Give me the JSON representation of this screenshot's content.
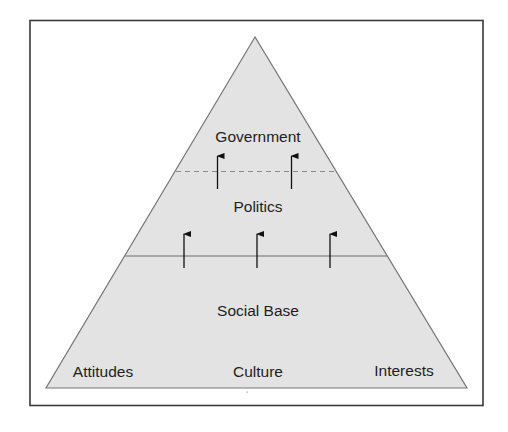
{
  "diagram": {
    "type": "pyramid",
    "colors": {
      "frame": "#3a3a3a",
      "pyramid_fill": "#e3e3e3",
      "pyramid_stroke": "#777777",
      "divider_solid": "#6f6f6f",
      "divider_dashed": "#8a8a8a",
      "arrow": "#111111",
      "text": "#1e1e1e"
    },
    "layers": [
      {
        "id": "government",
        "label": "Government",
        "position": "top"
      },
      {
        "id": "politics",
        "label": "Politics",
        "position": "middle"
      },
      {
        "id": "social_base",
        "label": "Social Base",
        "position": "bottom"
      }
    ],
    "dividers": [
      {
        "between": [
          "government",
          "politics"
        ],
        "style": "dashed"
      },
      {
        "between": [
          "politics",
          "social_base"
        ],
        "style": "solid"
      }
    ],
    "base_components": [
      {
        "label": "Attitudes"
      },
      {
        "label": "Culture"
      },
      {
        "label": "Interests"
      }
    ],
    "arrows": [
      {
        "from": "social_base",
        "to": "politics",
        "count": 3,
        "direction": "up"
      },
      {
        "from": "politics",
        "to": "government",
        "count": 2,
        "direction": "up"
      }
    ]
  }
}
